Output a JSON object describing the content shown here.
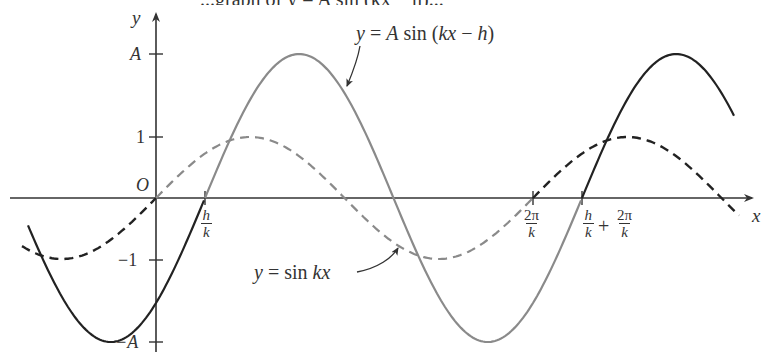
{
  "figure": {
    "caption_fragment": "...graph of y = A sin (kx − h)...",
    "axes": {
      "x_label": "x",
      "y_label": "y",
      "origin_label": "O"
    },
    "y_ticks": [
      {
        "label": "A",
        "value": "A"
      },
      {
        "label": "1",
        "value": 1
      },
      {
        "label": "−1",
        "value": -1
      },
      {
        "label": "−A",
        "value": "-A"
      }
    ],
    "x_ticks": [
      {
        "id": "h_over_k",
        "num": "h",
        "den": "k"
      },
      {
        "id": "two_pi_over_k",
        "num": "2π",
        "den": "k"
      },
      {
        "id": "h_over_k_plus",
        "num1": "h",
        "den1": "k",
        "plus": "+",
        "num2": "2π",
        "den2": "k"
      }
    ],
    "curves": [
      {
        "name": "shifted-sine",
        "label": "y = A sin (kx − h)",
        "style": "solid",
        "color_primary": "#222222",
        "color_highlight": "#8a8a8a"
      },
      {
        "name": "base-sine",
        "label": "y = sin kx",
        "style": "dashed",
        "color_primary": "#222222",
        "color_highlight": "#8a8a8a"
      }
    ],
    "annotations": [
      {
        "text_parts": [
          "y",
          " = ",
          "A",
          " sin (",
          "kx",
          " − ",
          "h",
          ")"
        ]
      },
      {
        "text_parts": [
          "y",
          " = sin ",
          "kx"
        ]
      }
    ]
  }
}
